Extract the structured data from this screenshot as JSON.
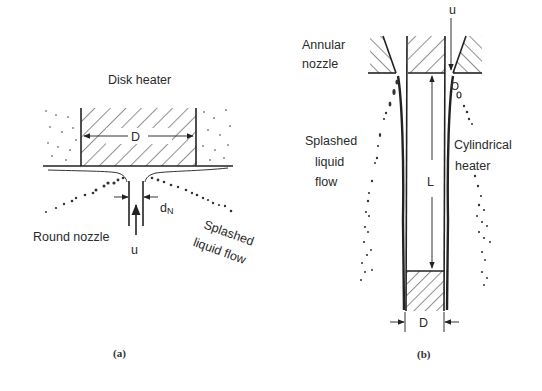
{
  "figure": {
    "panel_a": {
      "caption": "(a)",
      "title_label": "Disk heater",
      "dimension_label": "D",
      "nozzle_label": "Round nozzle",
      "nozzle_diameter_label": "d",
      "nozzle_diameter_subscript": "N",
      "velocity_label": "u",
      "splash_label_line1": "Splashed",
      "splash_label_line2": "liquid flow"
    },
    "panel_b": {
      "caption": "(b)",
      "nozzle_label_line1": "Annular",
      "nozzle_label_line2": "nozzle",
      "velocity_label": "u",
      "length_label": "L",
      "dimension_label": "D",
      "splash_label_line1": "Splashed",
      "splash_label_line2": "liquid",
      "splash_label_line3": "flow",
      "heater_label_line1": "Cylindrical",
      "heater_label_line2": "heater"
    }
  }
}
